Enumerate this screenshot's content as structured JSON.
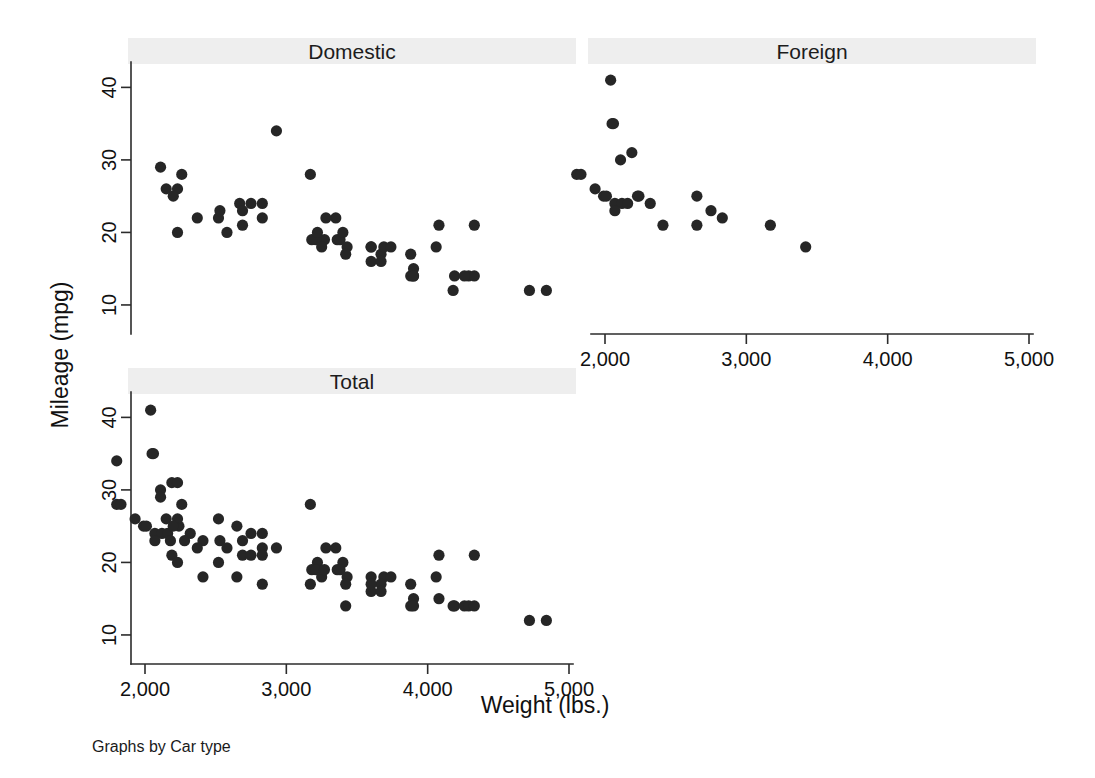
{
  "figure": {
    "y_axis_title": "Mileage (mpg)",
    "x_axis_title": "Weight (lbs.)",
    "note": "Graphs by Car type"
  },
  "panels": [
    {
      "key": "domestic",
      "title": "Domestic"
    },
    {
      "key": "foreign",
      "title": "Foreign"
    },
    {
      "key": "total",
      "title": "Total"
    }
  ],
  "axis": {
    "x_ticks": [
      "2,000",
      "3,000",
      "4,000",
      "5,000"
    ],
    "x_tick_values": [
      2000,
      3000,
      4000,
      5000
    ],
    "y_ticks": [
      "10",
      "20",
      "30",
      "40"
    ],
    "y_tick_values": [
      10,
      20,
      30,
      40
    ]
  },
  "style": {
    "marker_color": "#262626",
    "title_band_color": "#eeeeee",
    "axis_color": "#2b2b2b",
    "background": "#ffffff",
    "marker_radius": 5.6
  },
  "chart_data": {
    "type": "scatter",
    "title": "",
    "xlabel": "Weight (lbs.)",
    "ylabel": "Mileage (mpg)",
    "xlim": [
      1680,
      5020
    ],
    "ylim": [
      8,
      44
    ],
    "grid": false,
    "legend": "none",
    "layout": "3 panels: Domestic (top-left), Foreign (top-right), Total (bottom-left)",
    "note": "Graphs by Car type",
    "xticks": [
      2000,
      3000,
      4000,
      5000
    ],
    "yticks": [
      10,
      20,
      30,
      40
    ],
    "panels": [
      {
        "name": "Domestic",
        "n": 52,
        "points": [
          [
            2930,
            34
          ],
          [
            2230,
            26
          ],
          [
            3350,
            22
          ],
          [
            4080,
            21
          ],
          [
            3670,
            17
          ],
          [
            2230,
            20
          ],
          [
            3280,
            22
          ],
          [
            3880,
            14
          ],
          [
            4330,
            21
          ],
          [
            3900,
            15
          ],
          [
            4290,
            14
          ],
          [
            4330,
            14
          ],
          [
            3900,
            14
          ],
          [
            4260,
            14
          ],
          [
            3690,
            18
          ],
          [
            4180,
            12
          ],
          [
            4060,
            18
          ],
          [
            3600,
            16
          ],
          [
            3600,
            18
          ],
          [
            3740,
            18
          ],
          [
            3670,
            16
          ],
          [
            3880,
            17
          ],
          [
            3900,
            14
          ],
          [
            4190,
            14
          ],
          [
            3270,
            19
          ],
          [
            2110,
            29
          ],
          [
            2260,
            28
          ],
          [
            2750,
            24
          ],
          [
            3600,
            18
          ],
          [
            2200,
            25
          ],
          [
            2150,
            26
          ],
          [
            2670,
            24
          ],
          [
            2370,
            22
          ],
          [
            4720,
            12
          ],
          [
            4840,
            12
          ],
          [
            3360,
            19
          ],
          [
            3380,
            19
          ],
          [
            3400,
            20
          ],
          [
            3210,
            19
          ],
          [
            3180,
            19
          ],
          [
            3220,
            20
          ],
          [
            3430,
            18
          ],
          [
            3250,
            18
          ],
          [
            2690,
            21
          ],
          [
            2690,
            23
          ],
          [
            2830,
            22
          ],
          [
            2580,
            20
          ],
          [
            2520,
            22
          ],
          [
            2530,
            23
          ],
          [
            2830,
            24
          ],
          [
            3170,
            28
          ],
          [
            3420,
            17
          ]
        ]
      },
      {
        "name": "Foreign",
        "n": 22,
        "points": [
          [
            2040,
            41
          ],
          [
            2050,
            35
          ],
          [
            2060,
            35
          ],
          [
            2190,
            31
          ],
          [
            2110,
            30
          ],
          [
            1800,
            28
          ],
          [
            1830,
            28
          ],
          [
            1930,
            26
          ],
          [
            1990,
            25
          ],
          [
            2010,
            25
          ],
          [
            2240,
            25
          ],
          [
            2230,
            25
          ],
          [
            2070,
            24
          ],
          [
            2120,
            24
          ],
          [
            2160,
            24
          ],
          [
            2320,
            24
          ],
          [
            2650,
            25
          ],
          [
            2070,
            23
          ],
          [
            2410,
            21
          ],
          [
            2650,
            21
          ],
          [
            2750,
            23
          ],
          [
            2830,
            22
          ],
          [
            3170,
            21
          ],
          [
            3420,
            18
          ]
        ]
      },
      {
        "name": "Total",
        "n": 74,
        "points": [
          [
            2040,
            41
          ],
          [
            2050,
            35
          ],
          [
            2060,
            35
          ],
          [
            1800,
            34
          ],
          [
            2190,
            31
          ],
          [
            2110,
            30
          ],
          [
            2230,
            31
          ],
          [
            1800,
            28
          ],
          [
            1830,
            28
          ],
          [
            3170,
            28
          ],
          [
            2110,
            29
          ],
          [
            2260,
            28
          ],
          [
            1930,
            26
          ],
          [
            1990,
            25
          ],
          [
            2010,
            25
          ],
          [
            2240,
            25
          ],
          [
            2230,
            26
          ],
          [
            2150,
            26
          ],
          [
            2520,
            26
          ],
          [
            2070,
            24
          ],
          [
            2120,
            24
          ],
          [
            2160,
            24
          ],
          [
            2320,
            24
          ],
          [
            2650,
            25
          ],
          [
            2750,
            24
          ],
          [
            2830,
            24
          ],
          [
            2200,
            25
          ],
          [
            2070,
            23
          ],
          [
            2180,
            23
          ],
          [
            2280,
            23
          ],
          [
            2410,
            23
          ],
          [
            2530,
            23
          ],
          [
            2690,
            23
          ],
          [
            2370,
            22
          ],
          [
            2580,
            22
          ],
          [
            2830,
            22
          ],
          [
            2930,
            22
          ],
          [
            3280,
            22
          ],
          [
            3350,
            22
          ],
          [
            2190,
            21
          ],
          [
            2690,
            21
          ],
          [
            2750,
            21
          ],
          [
            2830,
            21
          ],
          [
            4080,
            21
          ],
          [
            4330,
            21
          ],
          [
            2230,
            20
          ],
          [
            2520,
            20
          ],
          [
            3400,
            20
          ],
          [
            3220,
            20
          ],
          [
            2410,
            18
          ],
          [
            2650,
            18
          ],
          [
            2830,
            17
          ],
          [
            3180,
            19
          ],
          [
            3210,
            19
          ],
          [
            3250,
            18
          ],
          [
            3270,
            19
          ],
          [
            3360,
            19
          ],
          [
            3380,
            19
          ],
          [
            3430,
            18
          ],
          [
            3600,
            18
          ],
          [
            3690,
            18
          ],
          [
            3740,
            18
          ],
          [
            4060,
            18
          ],
          [
            3170,
            17
          ],
          [
            3420,
            17
          ],
          [
            3600,
            16
          ],
          [
            3670,
            17
          ],
          [
            3670,
            16
          ],
          [
            3600,
            17
          ],
          [
            3880,
            17
          ],
          [
            3420,
            14
          ],
          [
            3880,
            14
          ],
          [
            3900,
            15
          ],
          [
            3900,
            14
          ],
          [
            4190,
            14
          ],
          [
            4260,
            14
          ],
          [
            4290,
            14
          ],
          [
            4330,
            14
          ],
          [
            4080,
            15
          ],
          [
            4180,
            14
          ],
          [
            4720,
            12
          ],
          [
            4840,
            12
          ]
        ]
      }
    ]
  }
}
